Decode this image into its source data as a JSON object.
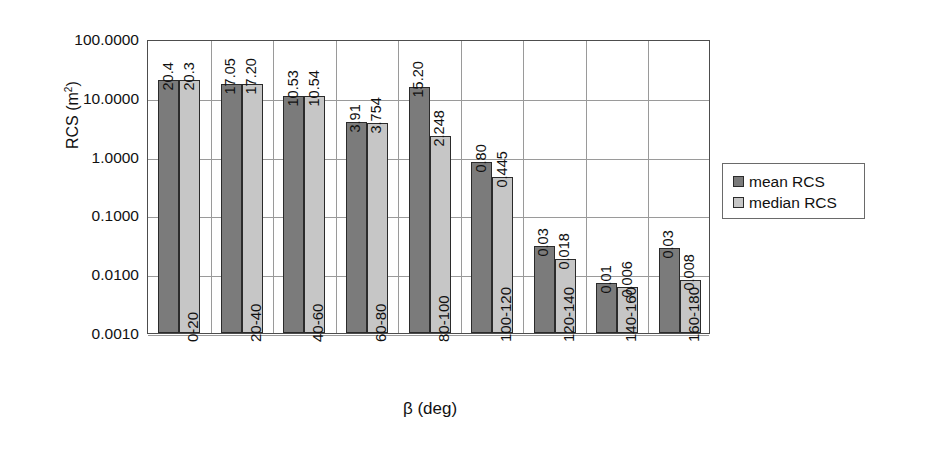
{
  "chart_data": {
    "type": "bar",
    "title": "",
    "xlabel": "β (deg)",
    "ylabel": "RCS (m²)",
    "yscale": "log",
    "ylim": [
      0.001,
      100
    ],
    "grid": true,
    "legend_position": "right",
    "categories": [
      "0-20",
      "20-40",
      "40-60",
      "60-80",
      "80-100",
      "100-120",
      "120-140",
      "140-160",
      "160-180"
    ],
    "ytick_labels": [
      "100.0000",
      "10.0000",
      "1.0000",
      "0.1000",
      "0.0100",
      "0.0010"
    ],
    "ytick_values": [
      100,
      10,
      1,
      0.1,
      0.01,
      0.001
    ],
    "series": [
      {
        "name": "mean RCS",
        "color": "#7b7b7b",
        "values": [
          20.4,
          17.05,
          10.53,
          3.91,
          15.2,
          0.8,
          0.03,
          0.01,
          0.03
        ],
        "labels": [
          "20.4",
          "17.05",
          "10.53",
          "3.91",
          "15.20",
          "0.80",
          "0.03",
          "0.01",
          "0.03"
        ],
        "plotted": [
          20.4,
          17.05,
          10.53,
          3.91,
          15.2,
          0.8,
          0.0305,
          0.0072,
          0.0278
        ]
      },
      {
        "name": "median RCS",
        "color": "#c6c6c6",
        "values": [
          20.3,
          17.2,
          10.54,
          3.754,
          2.248,
          0.445,
          0.018,
          0.006,
          0.008
        ],
        "labels": [
          "20.3",
          "17.20",
          "10.54",
          "3.754",
          "2.248",
          "0.445",
          "0.018",
          "0.006",
          "0.008"
        ],
        "plotted": [
          20.3,
          17.2,
          10.54,
          3.754,
          2.248,
          0.445,
          0.018,
          0.006,
          0.008
        ]
      }
    ]
  },
  "legend": {
    "items": [
      {
        "label": "mean RCS",
        "key": "mean"
      },
      {
        "label": "median RCS",
        "key": "median"
      }
    ]
  },
  "axis": {
    "y_title_main": "RCS (m",
    "y_title_sup": "2",
    "y_title_close": ")",
    "x_title": "β (deg)"
  }
}
